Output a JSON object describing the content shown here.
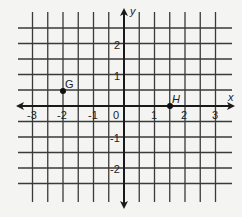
{
  "diagram": {
    "type": "coordinate-plane",
    "axes": {
      "x_label": "x",
      "y_label": "y",
      "x_ticks": [
        "-3",
        "-2",
        "-1",
        "0",
        "1",
        "2",
        "3"
      ],
      "y_ticks": [
        "2",
        "1",
        "-1",
        "-2"
      ],
      "x_range": [
        -3.5,
        3.5
      ],
      "y_range": [
        -3,
        3
      ],
      "grid_step": 0.5
    },
    "points": [
      {
        "label": "G",
        "x": -2,
        "y": 0.5
      },
      {
        "label": "H",
        "x": 1.5,
        "y": 0
      }
    ],
    "colors": {
      "grid": "#3a3a3a",
      "axis": "#1a1a1a",
      "point": "#111111",
      "background": "#f4f4f2"
    }
  }
}
